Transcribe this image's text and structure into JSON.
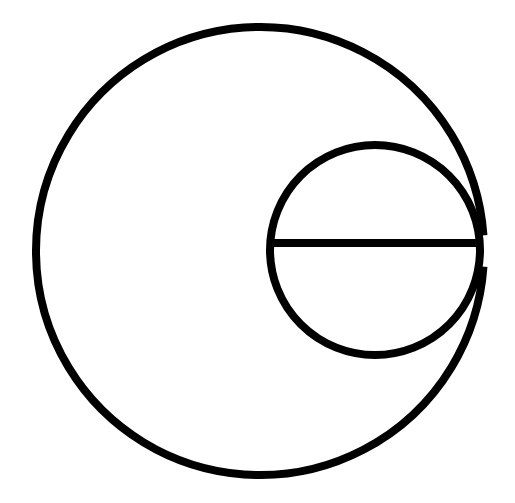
{
  "canvas": {
    "width": 515,
    "height": 503,
    "background_color": "#FFFFFF"
  },
  "artwork": {
    "name": "lowercase-letter-e-logo",
    "description": "Monochrome line-art glyph: a large open outer circle overlapping a smaller inner circle with a horizontal crossbar, forming a lowercase letter e",
    "stroke_color": "#000000",
    "fill": "none",
    "stroke_width": 8,
    "letter": "e"
  },
  "shapes": {
    "outer_ring": {
      "label": "outer-circle",
      "center_x": 260,
      "center_y": 251,
      "radius": 224,
      "stroke_width": 8,
      "stroke_color": "#000000",
      "gap_start_deg": -4,
      "gap_end_deg": 4,
      "note": "open circle with a small gap on the right side where the crossbar terminates"
    },
    "inner_ring": {
      "label": "inner-circle",
      "center_x": 375,
      "center_y": 250,
      "radius": 105,
      "stroke_width": 8,
      "stroke_color": "#000000"
    },
    "crossbar": {
      "label": "horizontal-crossbar",
      "x1": 268,
      "y1": 243,
      "x2": 482,
      "y2": 243,
      "stroke_width": 8,
      "stroke_color": "#000000"
    }
  }
}
